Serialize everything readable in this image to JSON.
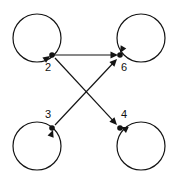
{
  "figure": {
    "type": "directed-graph",
    "background_color": "#ffffff",
    "stroke_color": "#141414",
    "label_color": "#111111",
    "width": 174,
    "height": 182
  },
  "nodes": [
    {
      "id": "n2",
      "label": "2",
      "x": 52,
      "y": 55,
      "label_x": 48,
      "label_y": 68,
      "loop_center_x": 37,
      "loop_center_y": 38,
      "loop_radius": 24,
      "has_self_loop": true,
      "position": "top-left"
    },
    {
      "id": "n6",
      "label": "6",
      "x": 120,
      "y": 55,
      "label_x": 124,
      "label_y": 68,
      "loop_center_x": 141,
      "loop_center_y": 38,
      "loop_radius": 24,
      "has_self_loop": true,
      "position": "top-right"
    },
    {
      "id": "n3",
      "label": "3",
      "x": 52,
      "y": 128,
      "label_x": 48,
      "label_y": 115,
      "loop_center_x": 37,
      "loop_center_y": 146,
      "loop_radius": 24,
      "has_self_loop": true,
      "position": "bottom-left"
    },
    {
      "id": "n4",
      "label": "4",
      "x": 120,
      "y": 128,
      "label_x": 124,
      "label_y": 115,
      "loop_center_x": 141,
      "loop_center_y": 146,
      "loop_radius": 24,
      "has_self_loop": true,
      "position": "bottom-right"
    }
  ],
  "edges": [
    {
      "id": "e-2-6",
      "from": "2",
      "to": "6",
      "x1": 54,
      "y1": 55,
      "x2": 118,
      "y2": 55,
      "directed": true
    },
    {
      "id": "e-2-4",
      "from": "2",
      "to": "4",
      "x1": 55,
      "y1": 58,
      "x2": 117,
      "y2": 125,
      "directed": true
    },
    {
      "id": "e-3-6",
      "from": "3",
      "to": "6",
      "x1": 55,
      "y1": 125,
      "x2": 117,
      "y2": 59,
      "directed": true
    }
  ],
  "self_loop_arrows": [
    {
      "node": "2",
      "tip_x": 50,
      "tip_y": 56,
      "angle": 325
    },
    {
      "node": "6",
      "tip_x": 120,
      "tip_y": 53,
      "angle": 120
    },
    {
      "node": "3",
      "tip_x": 53,
      "tip_y": 130,
      "angle": 290
    },
    {
      "node": "4",
      "tip_x": 121,
      "tip_y": 127,
      "angle": 205
    }
  ]
}
